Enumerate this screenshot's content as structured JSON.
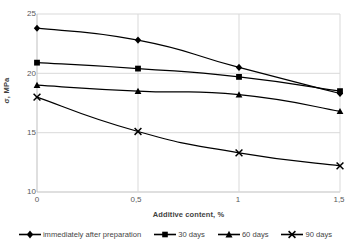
{
  "chart_data": {
    "type": "line",
    "title": "",
    "xlabel": "Additive content, %",
    "ylabel": "σ, MPa",
    "x": [
      0,
      0.5,
      1,
      1.5
    ],
    "xticklabels": [
      "0",
      "0,5",
      "1",
      "1,5"
    ],
    "yticklabels": [
      "10",
      "15",
      "20",
      "25"
    ],
    "yticks": [
      10,
      15,
      20,
      25
    ],
    "xlim": [
      0,
      1.5
    ],
    "ylim": [
      10,
      25
    ],
    "grid": true,
    "legend_position": "bottom",
    "series": [
      {
        "name": "immediately after preparation",
        "marker": "diamond",
        "values": [
          23.8,
          22.8,
          20.5,
          18.3
        ]
      },
      {
        "name": "30 days",
        "marker": "square",
        "values": [
          20.9,
          20.4,
          19.7,
          18.5
        ]
      },
      {
        "name": "60 days",
        "marker": "triangle",
        "values": [
          19.0,
          18.5,
          18.2,
          16.8
        ]
      },
      {
        "name": "90 days",
        "marker": "x",
        "values": [
          18.0,
          15.1,
          13.3,
          12.2
        ]
      }
    ],
    "colors": {
      "line": "#000000",
      "grid": "#d9d9d9",
      "axis": "#bfbfbf",
      "text": "#595959"
    }
  },
  "axis": {
    "y_title": "σ, MPa",
    "x_title": "Additive content, %",
    "yticks": [
      "25",
      "20",
      "15",
      "10"
    ],
    "xticks": [
      "0",
      "0,5",
      "1",
      "1,5"
    ]
  },
  "legend": {
    "items": [
      {
        "label": "immediately after preparation",
        "marker": "diamond-marker"
      },
      {
        "label": "30 days",
        "marker": "square-marker"
      },
      {
        "label": "60 days",
        "marker": "triangle-marker"
      },
      {
        "label": "90 days",
        "marker": "x-marker"
      }
    ]
  }
}
